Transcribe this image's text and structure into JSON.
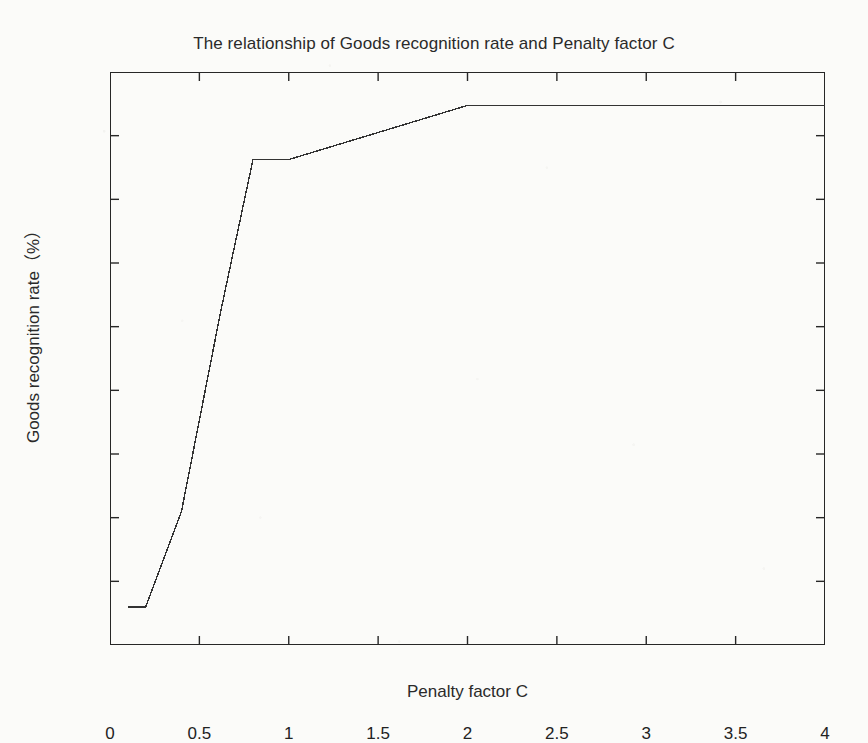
{
  "chart_data": {
    "type": "line",
    "title": "The relationship of Goods recognition rate and Penalty factor C",
    "xlabel": "Penalty factor C",
    "ylabel": "Goods recognition rate（%）",
    "xlim": [
      0,
      4
    ],
    "ylim": [
      76,
      94
    ],
    "xticks": [
      0,
      0.5,
      1,
      1.5,
      2,
      2.5,
      3,
      3.5,
      4
    ],
    "xtick_labels": [
      "0",
      "0.5",
      "1",
      "1.5",
      "2",
      "2.5",
      "3",
      "3.5",
      "4"
    ],
    "yticks": [
      76,
      78,
      80,
      82,
      84,
      86,
      88,
      90,
      92,
      94
    ],
    "ytick_labels": [
      "76",
      "78",
      "80",
      "82",
      "84",
      "86",
      "88",
      "90",
      "92",
      "94"
    ],
    "grid": false,
    "legend": null,
    "line_color": "#333333",
    "line_width": 1.4,
    "series": [
      {
        "name": "Goods recognition rate",
        "x": [
          0.1,
          0.2,
          0.4,
          0.62,
          0.8,
          1.0,
          2.0,
          4.0
        ],
        "y": [
          77.2,
          77.2,
          80.2,
          86.5,
          91.25,
          91.25,
          92.95,
          92.95
        ]
      }
    ]
  },
  "figure": {
    "background_color": "#fbfbf9",
    "axis_color": "#272727"
  }
}
